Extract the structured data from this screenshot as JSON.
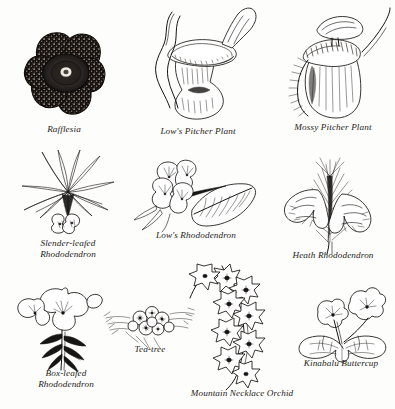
{
  "page": {
    "kind": "botanical-illustration-plate",
    "background_color": "#fdfdfb",
    "ink_color": "#161412",
    "caption_style": "italic-serif"
  },
  "figures": [
    {
      "id": "rafflesia",
      "caption": "Rafflesia",
      "row": 1,
      "column": 1,
      "subject": "five-lobed stippled flower with central disc"
    },
    {
      "id": "lows-pitcher-plant",
      "caption": "Low's Pitcher Plant",
      "row": 1,
      "column": 2,
      "subject": "trumpet-shaped pitcher with flared mouth and tendrils"
    },
    {
      "id": "mossy-pitcher-plant",
      "caption": "Mossy Pitcher Plant",
      "row": 1,
      "column": 3,
      "subject": "ovoid pitcher with flat lid, ribbed peristome and fringed wings"
    },
    {
      "id": "slender-leafed-rhododendron",
      "caption": "Slender-leafed\nRhododendron",
      "row": 2,
      "column": 1,
      "subject": "whorl of narrow strap leaves above small flowers"
    },
    {
      "id": "lows-rhododendron",
      "caption": "Low's Rhododendron",
      "row": 2,
      "column": 2,
      "subject": "cluster of trumpet flowers beside a veined leaf"
    },
    {
      "id": "heath-rhododendron",
      "caption": "Heath Rhododendron",
      "row": 2,
      "column": 3,
      "subject": "pair of drooping bell flowers among needle foliage"
    },
    {
      "id": "box-leafed-rhododendron",
      "caption": "Box-leafed\nRhododendron",
      "row": 3,
      "column": 1,
      "subject": "open flowers atop a leafy stem"
    },
    {
      "id": "tea-tree",
      "caption": "Tea-tree",
      "row": 3,
      "column": 2,
      "subject": "spray of small round flowers with fine leaves"
    },
    {
      "id": "mountain-necklace-orchid",
      "caption": "Mountain Necklace Orchid",
      "row": 3,
      "column": 3,
      "subject": "pendent chain of star-shaped flowers"
    },
    {
      "id": "kinabalu-buttercup",
      "caption": "Kinabalu Buttercup",
      "row": 3,
      "column": 4,
      "subject": "small flowers above lobed palmate leaves"
    }
  ]
}
